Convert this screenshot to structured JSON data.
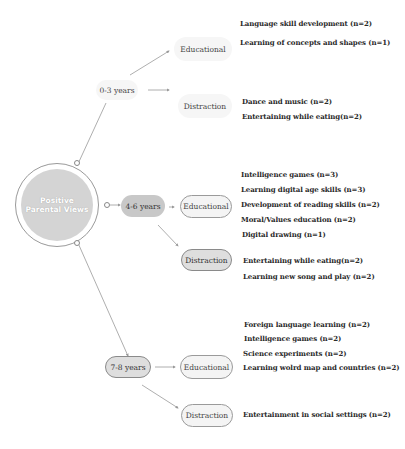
{
  "root": {
    "line1": "Positive",
    "line2": "Parental Views"
  },
  "groups": [
    {
      "age": "0-3 years",
      "educational_label": "Educational",
      "distraction_label": "Distraction",
      "educational": [
        "Language skill development (n=2)",
        "Learning of concepts and shapes (n=1)"
      ],
      "distraction": [
        "Dance and music (n=2)",
        "Entertaining while eating(n=2)"
      ]
    },
    {
      "age": "4-6 years",
      "educational_label": "Educational",
      "distraction_label": "Distraction",
      "educational": [
        "Intelligence games (n=3)",
        "Learning digital age skills (n=3)",
        "Development of reading skills (n=2)",
        "Moral/Values education (n=2)",
        "Digital drawing (n=1)"
      ],
      "distraction": [
        "Entertaining while eating(n=2)",
        "Learning new song and play  (n=2)"
      ]
    },
    {
      "age": "7-8 years",
      "educational_label": "Educational",
      "distraction_label": "Distraction",
      "educational": [
        "Foreign language learning (n=2)",
        "Intelligence games (n=2)",
        "Science experiments (n=2)",
        "Learning wolrd map and countries (n=2)"
      ],
      "distraction": [
        "Entertainment in social settings  (n=2)"
      ]
    }
  ]
}
